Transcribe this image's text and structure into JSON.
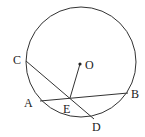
{
  "diagram": {
    "type": "geometry-circle",
    "circle": {
      "center_label": "O",
      "cx": 81,
      "cy": 62,
      "r": 55
    },
    "points": [
      {
        "label": "C",
        "x": 26,
        "y": 61,
        "lx": 15,
        "ly": 64
      },
      {
        "label": "A",
        "x": 40,
        "y": 101,
        "lx": 25,
        "ly": 107
      },
      {
        "label": "E",
        "x": 70,
        "y": 98,
        "lx": 64,
        "ly": 112
      },
      {
        "label": "D",
        "x": 94,
        "y": 119,
        "lx": 93,
        "ly": 131
      },
      {
        "label": "B",
        "x": 128,
        "y": 93,
        "lx": 131,
        "ly": 97
      },
      {
        "label": "O",
        "x": 80,
        "y": 64,
        "lx": 86,
        "ly": 68
      }
    ],
    "segments": [
      {
        "name": "chord-CD",
        "from": "C",
        "to": "D"
      },
      {
        "name": "chord-AB",
        "from": "A",
        "to": "B"
      },
      {
        "name": "segment-OE",
        "from": "O",
        "to": "E"
      }
    ],
    "labels": {
      "C": "C",
      "A": "A",
      "E": "E",
      "D": "D",
      "B": "B",
      "O": "O"
    }
  }
}
